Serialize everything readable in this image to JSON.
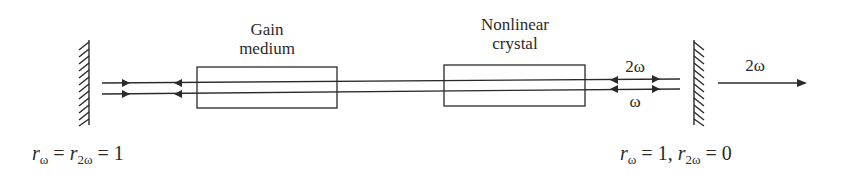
{
  "diagram": {
    "type": "intracavity second-harmonic generation laser cavity",
    "colors": {
      "stroke": "#2a2a2a",
      "background": "#ffffff"
    },
    "components": {
      "left_mirror": {
        "label": "mirror-left"
      },
      "gain_medium": {
        "line1": "Gain",
        "line2": "medium"
      },
      "nonlinear_crystal": {
        "line1": "Nonlinear",
        "line2": "crystal"
      },
      "right_mirror": {
        "label": "mirror-right"
      }
    },
    "beam_labels": {
      "upper_beam": "2ω",
      "lower_beam": "ω",
      "output": "2ω"
    },
    "equations": {
      "left": {
        "r1": "r",
        "s1": "ω",
        "eq1": " = ",
        "r2": "r",
        "s2": "2ω",
        "eq2": " = 1"
      },
      "right": {
        "r1": "r",
        "s1": "ω",
        "eq1": " = 1, ",
        "r2": "r",
        "s2": "2ω",
        "eq2": " = 0"
      }
    }
  }
}
